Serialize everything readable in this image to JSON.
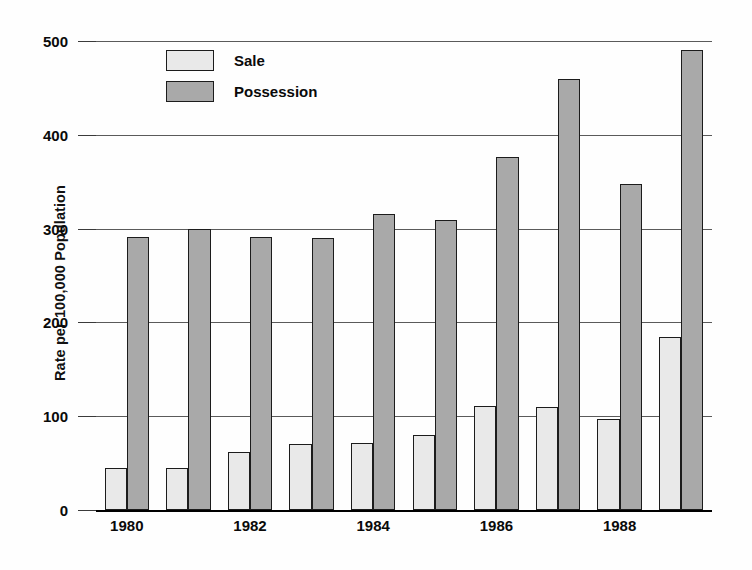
{
  "chart_data": {
    "type": "bar",
    "title": "",
    "subtitle": "",
    "xlabel": "",
    "ylabel": "Rate per 100,000 Population",
    "categories": [
      "1980",
      "1981",
      "1982",
      "1983",
      "1984",
      "1985",
      "1986",
      "1987",
      "1988",
      "1989"
    ],
    "visible_tick_labels": [
      "1980",
      "1982",
      "1984",
      "1986",
      "1988"
    ],
    "series": [
      {
        "name": "Sale",
        "color": "#e9e9e9",
        "values": [
          45,
          45,
          62,
          70,
          71,
          80,
          111,
          110,
          97,
          184
        ]
      },
      {
        "name": "Possession",
        "color": "#a9a9a9",
        "values": [
          291,
          300,
          291,
          290,
          316,
          309,
          376,
          460,
          348,
          490
        ]
      }
    ],
    "ylim": [
      0,
      500
    ],
    "yticks": [
      0,
      100,
      200,
      300,
      400,
      500
    ],
    "ytick_labels": [
      "0",
      "100",
      "200",
      "300",
      "400",
      "500"
    ],
    "grid": true,
    "grid_axis": "y",
    "legend_position": "upper-left-inside",
    "bar_edge_color": "#1c1c1c"
  },
  "legend": {
    "items": [
      {
        "label": "Sale",
        "swatch_name": "legend-swatch-sale"
      },
      {
        "label": "Possession",
        "swatch_name": "legend-swatch-possession"
      }
    ]
  }
}
